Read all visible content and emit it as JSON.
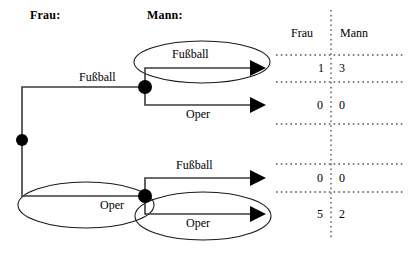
{
  "figure": {
    "headers": {
      "left": "Frau:",
      "right": "Mann:"
    },
    "edge_labels": {
      "trunk_top": "Fußball",
      "branch_top_1": "Fußball",
      "branch_top_2": "Oper",
      "trunk_bottom": "Oper",
      "branch_bottom_1": "Fußball",
      "branch_bottom_2": "Oper"
    },
    "line_color": "#1a1a1a",
    "dot_color": "#000000",
    "dotted_color": "#555555"
  },
  "table": {
    "columns": [
      "Frau",
      "Mann"
    ],
    "rows": [
      {
        "frau": "1",
        "mann": "3"
      },
      {
        "frau": "0",
        "mann": "0"
      },
      {
        "frau": "0",
        "mann": "0"
      },
      {
        "frau": "5",
        "mann": "2"
      }
    ]
  }
}
